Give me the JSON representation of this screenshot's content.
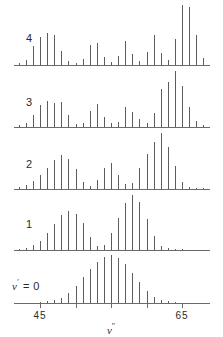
{
  "chart_data": {
    "type": "bar",
    "title": "",
    "xlabel": "v″",
    "ylabel": "",
    "xlim": [
      41.5,
      69.0
    ],
    "grid": false,
    "legend": null,
    "xticks": [
      45,
      50,
      55,
      60,
      65
    ],
    "xticklabels": [
      "45",
      "",
      "",
      "",
      "65"
    ],
    "panels": [
      {
        "name": "v-prime-4",
        "label": "4",
        "label_text": "4",
        "x": [
          42,
          43,
          44,
          45,
          46,
          47,
          48,
          49,
          50,
          51,
          52,
          53,
          54,
          55,
          56,
          57,
          58,
          59,
          60,
          61,
          62,
          63,
          64,
          65,
          66,
          67,
          68
        ],
        "values": [
          2,
          5,
          19,
          28,
          32,
          30,
          14,
          4,
          2,
          6,
          20,
          22,
          8,
          3,
          9,
          24,
          11,
          4,
          13,
          30,
          12,
          5,
          26,
          60,
          58,
          30,
          7
        ]
      },
      {
        "name": "v-prime-3",
        "label": "3",
        "label_text": "3",
        "x": [
          42,
          43,
          44,
          45,
          46,
          47,
          48,
          49,
          50,
          51,
          52,
          53,
          54,
          55,
          56,
          57,
          58,
          59,
          60,
          61,
          62,
          63,
          64,
          65,
          66,
          67,
          68
        ],
        "values": [
          2,
          4,
          13,
          24,
          29,
          27,
          28,
          13,
          3,
          4,
          18,
          25,
          11,
          4,
          6,
          22,
          17,
          9,
          4,
          16,
          42,
          50,
          62,
          45,
          22,
          7,
          2
        ]
      },
      {
        "name": "v-prime-2",
        "label": "2",
        "label_text": "2",
        "x": [
          42,
          43,
          44,
          45,
          46,
          47,
          48,
          49,
          50,
          51,
          52,
          53,
          54,
          55,
          56,
          57,
          58,
          59,
          60,
          61,
          62,
          63,
          64,
          65,
          66,
          67,
          68
        ],
        "values": [
          2,
          4,
          8,
          15,
          22,
          31,
          36,
          32,
          21,
          7,
          3,
          10,
          22,
          27,
          15,
          5,
          6,
          22,
          37,
          50,
          59,
          44,
          24,
          7,
          2,
          1,
          1
        ]
      },
      {
        "name": "v-prime-1",
        "label": "1",
        "label_text": "1",
        "x": [
          42,
          43,
          44,
          45,
          46,
          47,
          48,
          49,
          50,
          51,
          52,
          53,
          54,
          55,
          56,
          57,
          58,
          59,
          60,
          61,
          62,
          63,
          64,
          65,
          66,
          67,
          68
        ],
        "values": [
          1,
          2,
          5,
          9,
          17,
          26,
          36,
          40,
          37,
          27,
          13,
          4,
          5,
          17,
          33,
          48,
          56,
          49,
          32,
          14,
          4,
          2,
          1,
          1,
          0,
          0,
          0
        ]
      },
      {
        "name": "v-prime-0",
        "label": "ν′ = 0",
        "label_text": "0",
        "x": [
          42,
          43,
          44,
          45,
          46,
          47,
          48,
          49,
          50,
          51,
          52,
          53,
          54,
          55,
          56,
          57,
          58,
          59,
          60,
          61,
          62,
          63,
          64,
          65,
          66,
          67,
          68
        ],
        "values": [
          0,
          0,
          0,
          1,
          2,
          4,
          6,
          12,
          20,
          30,
          40,
          48,
          54,
          56,
          52,
          45,
          35,
          24,
          14,
          7,
          3,
          2,
          1,
          0,
          0,
          0,
          0
        ]
      }
    ]
  },
  "axis": {
    "title": "v",
    "title_prime": "″",
    "ticks": [
      {
        "value": 45,
        "label": "45"
      },
      {
        "value": 50,
        "label": ""
      },
      {
        "value": 55,
        "label": ""
      },
      {
        "value": 60,
        "label": ""
      },
      {
        "value": 65,
        "label": "65"
      }
    ]
  },
  "labels": {
    "panel4": "4",
    "panel3": "3",
    "panel2": "2",
    "panel1": "1",
    "panel0_prefix": "v",
    "panel0_prime": "′",
    "panel0_suffix": " = 0"
  },
  "colors": {
    "stick": "#5c5c5c",
    "axis": "#6a6a6a",
    "text": "#2a2a2a",
    "background": "#ffffff"
  }
}
